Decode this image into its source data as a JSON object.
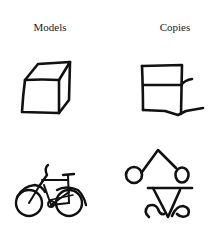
{
  "columns": [
    {
      "id": "models",
      "label": "Models"
    },
    {
      "id": "copies",
      "label": "Copies"
    }
  ],
  "rows": [
    {
      "id": "cube",
      "model": "cube drawing",
      "copy": "box copy drawing"
    },
    {
      "id": "bicycle",
      "model": "bicycle drawing",
      "copy": "bicycle copy drawing"
    }
  ],
  "colors": {
    "ink": "#111111",
    "background": "#ffffff"
  }
}
